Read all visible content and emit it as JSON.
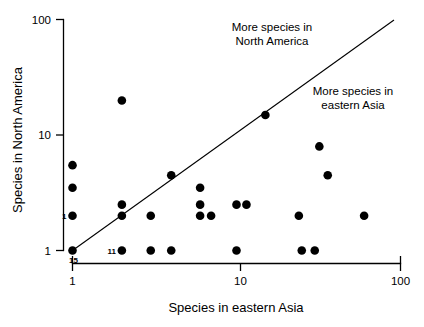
{
  "chart_data": {
    "type": "scatter",
    "title": "",
    "xlabel": "Species in eastern Asia",
    "ylabel": "Species in North America",
    "xscale": "log",
    "yscale": "log",
    "xlim": [
      1,
      100
    ],
    "ylim": [
      1,
      100
    ],
    "xticks": [
      1,
      10,
      100
    ],
    "xtick_labels": [
      "1",
      "10",
      "100"
    ],
    "yticks": [
      1,
      10,
      100
    ],
    "ytick_labels": [
      "1",
      "10",
      "100"
    ],
    "grid": false,
    "legend": "none",
    "marker": "filled-circle",
    "marker_color": "#000000",
    "reference_line": {
      "description": "1:1 line of equal species richness",
      "from": [
        1,
        1
      ],
      "to": [
        100,
        100
      ]
    },
    "annotations": [
      {
        "text_line1": "More species in",
        "text_line2": "North America",
        "x": 15,
        "y": 62,
        "align": "center"
      },
      {
        "text_line1": "More species in",
        "text_line2": "eastern Asia",
        "x": 48,
        "y": 24,
        "align": "center"
      }
    ],
    "point_labels": [
      {
        "label": "15",
        "x": 1,
        "y": 1,
        "position": "below-right"
      },
      {
        "label": "1",
        "x": 1,
        "y": 2,
        "position": "left"
      },
      {
        "label": "11",
        "x": 2,
        "y": 1,
        "position": "left"
      }
    ],
    "points": [
      {
        "x": 1,
        "y": 1
      },
      {
        "x": 1,
        "y": 2
      },
      {
        "x": 1,
        "y": 3.5
      },
      {
        "x": 1,
        "y": 5.5
      },
      {
        "x": 2,
        "y": 1
      },
      {
        "x": 2,
        "y": 2
      },
      {
        "x": 2,
        "y": 2.5
      },
      {
        "x": 2,
        "y": 20
      },
      {
        "x": 3,
        "y": 1
      },
      {
        "x": 3,
        "y": 2
      },
      {
        "x": 4,
        "y": 1
      },
      {
        "x": 4,
        "y": 4.5
      },
      {
        "x": 6,
        "y": 2
      },
      {
        "x": 6,
        "y": 2.5
      },
      {
        "x": 6,
        "y": 3.5
      },
      {
        "x": 7,
        "y": 2
      },
      {
        "x": 10,
        "y": 1
      },
      {
        "x": 10,
        "y": 2.5
      },
      {
        "x": 11.5,
        "y": 2.5
      },
      {
        "x": 15,
        "y": 15
      },
      {
        "x": 24,
        "y": 2
      },
      {
        "x": 25,
        "y": 1
      },
      {
        "x": 30,
        "y": 1
      },
      {
        "x": 32,
        "y": 8
      },
      {
        "x": 36,
        "y": 4.5
      },
      {
        "x": 60,
        "y": 2
      }
    ]
  },
  "axes": {
    "x_title": "Species in eastern Asia",
    "y_title": "Species in North America",
    "x_tick_labels": [
      "1",
      "10",
      "100"
    ],
    "y_tick_labels": [
      "1",
      "10",
      "100"
    ]
  },
  "annotations": {
    "upper_left_line1": "More species in",
    "upper_left_line2": "North America",
    "lower_right_line1": "More species in",
    "lower_right_line2": "eastern Asia"
  },
  "point_labels": {
    "n15": "15",
    "n1": "1",
    "n11": "11"
  },
  "colors": {
    "marker": "#000000",
    "axis": "#000000",
    "background": "#ffffff"
  }
}
